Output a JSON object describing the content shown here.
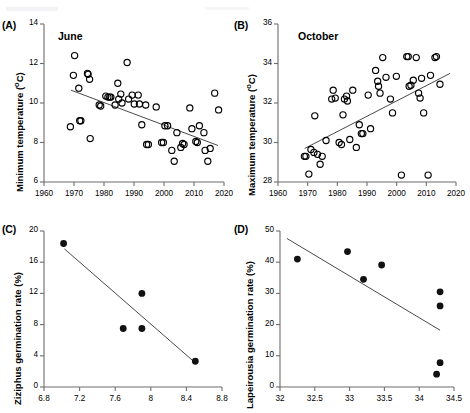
{
  "figure": {
    "width": 463,
    "height": 413,
    "background": "#ffffff",
    "marker_open_color": "#000000",
    "marker_filled_color": "#111111",
    "axis_color": "#6d6d6d",
    "trend_color": "#4a4a4a"
  },
  "chart_data": [
    {
      "type": "scatter",
      "panel": "A",
      "tag": "(A)",
      "title": "June",
      "xlabel": "",
      "ylabel": "Minimum temperature (oC)",
      "xlim": [
        1960,
        2020
      ],
      "ylim": [
        6,
        14
      ],
      "xticks": [
        1960,
        1970,
        1980,
        1990,
        2000,
        2010,
        2020
      ],
      "xtick_labels": [
        "1960",
        "1970",
        "1980",
        "1990",
        "2000",
        "2010",
        "2020"
      ],
      "yticks": [
        6,
        8,
        10,
        12,
        14
      ],
      "ytick_labels": [
        "6",
        "8",
        "10",
        "12",
        "14"
      ],
      "grid": false,
      "legend": "none",
      "marker": "open-circle",
      "trend": {
        "x": [
          1969,
          2018
        ],
        "y": [
          10.65,
          7.85
        ]
      },
      "points": [
        [
          1968.8,
          8.8
        ],
        [
          1969.8,
          11.4
        ],
        [
          1970.2,
          12.4
        ],
        [
          1971.6,
          10.75
        ],
        [
          1971.9,
          9.1
        ],
        [
          1972.3,
          9.1
        ],
        [
          1974.5,
          11.5
        ],
        [
          1974.7,
          11.45
        ],
        [
          1975.2,
          11.2
        ],
        [
          1975.4,
          8.2
        ],
        [
          1978.4,
          9.9
        ],
        [
          1978.9,
          9.85
        ],
        [
          1980.6,
          10.35
        ],
        [
          1981.3,
          10.3
        ],
        [
          1981.9,
          10.3
        ],
        [
          1982.3,
          10.3
        ],
        [
          1983.7,
          9.9
        ],
        [
          1984.6,
          11.0
        ],
        [
          1984.9,
          10.2
        ],
        [
          1985.6,
          10.45
        ],
        [
          1986.0,
          10.0
        ],
        [
          1987.7,
          12.05
        ],
        [
          1988.2,
          10.2
        ],
        [
          1989.4,
          10.4
        ],
        [
          1990.1,
          9.95
        ],
        [
          1991.4,
          10.4
        ],
        [
          1991.8,
          9.95
        ],
        [
          1992.6,
          8.9
        ],
        [
          1993.9,
          9.9
        ],
        [
          1994.2,
          7.9
        ],
        [
          1994.8,
          7.9
        ],
        [
          1997.4,
          9.8
        ],
        [
          1999.2,
          8.0
        ],
        [
          1999.8,
          8.0
        ],
        [
          2000.3,
          8.85
        ],
        [
          2001.2,
          8.85
        ],
        [
          2002.6,
          7.6
        ],
        [
          2003.4,
          7.05
        ],
        [
          2004.3,
          8.5
        ],
        [
          2005.6,
          7.75
        ],
        [
          2006.2,
          7.95
        ],
        [
          2006.7,
          7.9
        ],
        [
          2008.6,
          9.75
        ],
        [
          2009.3,
          8.7
        ],
        [
          2010.6,
          8.05
        ],
        [
          2011.1,
          8.0
        ],
        [
          2011.8,
          8.85
        ],
        [
          2013.3,
          8.5
        ],
        [
          2013.7,
          7.6
        ],
        [
          2014.6,
          7.05
        ],
        [
          2015.4,
          7.7
        ],
        [
          2016.9,
          10.5
        ],
        [
          2018.2,
          9.65
        ]
      ]
    },
    {
      "type": "scatter",
      "panel": "B",
      "tag": "(B)",
      "title": "October",
      "xlabel": "",
      "ylabel": "Maximum temperature (oC)",
      "xlim": [
        1960,
        2020
      ],
      "ylim": [
        28,
        36
      ],
      "xticks": [
        1960,
        1970,
        1980,
        1990,
        2000,
        2010,
        2020
      ],
      "xtick_labels": [
        "1960",
        "1970",
        "1980",
        "1990",
        "2000",
        "2010",
        "2020"
      ],
      "yticks": [
        28,
        30,
        32,
        34,
        36
      ],
      "ytick_labels": [
        "28",
        "30",
        "32",
        "34",
        "36"
      ],
      "grid": false,
      "legend": "none",
      "marker": "open-circle",
      "trend": {
        "x": [
          1969,
          2018
        ],
        "y": [
          29.7,
          33.5
        ]
      },
      "points": [
        [
          1968.9,
          29.3
        ],
        [
          1969.4,
          29.3
        ],
        [
          1970.4,
          28.4
        ],
        [
          1971.1,
          29.65
        ],
        [
          1972.1,
          29.5
        ],
        [
          1972.4,
          31.35
        ],
        [
          1973.3,
          29.4
        ],
        [
          1974.2,
          28.9
        ],
        [
          1974.9,
          29.3
        ],
        [
          1976.2,
          30.1
        ],
        [
          1978.1,
          32.2
        ],
        [
          1778.9,
          30.0
        ],
        [
          1978.6,
          32.65
        ],
        [
          1979.3,
          32.25
        ],
        [
          1980.6,
          30.0
        ],
        [
          1981.4,
          29.9
        ],
        [
          1981.9,
          31.4
        ],
        [
          1982.4,
          32.2
        ],
        [
          1983.1,
          32.35
        ],
        [
          1983.4,
          32.1
        ],
        [
          1984.2,
          30.15
        ],
        [
          1985.2,
          32.65
        ],
        [
          1986.4,
          29.75
        ],
        [
          1987.4,
          30.9
        ],
        [
          1988.1,
          30.45
        ],
        [
          1988.6,
          30.45
        ],
        [
          1990.4,
          32.4
        ],
        [
          1991.2,
          30.7
        ],
        [
          1992.9,
          33.65
        ],
        [
          1993.6,
          33.1
        ],
        [
          1993.9,
          32.85
        ],
        [
          1994.4,
          32.5
        ],
        [
          1995.3,
          34.3
        ],
        [
          1996.4,
          33.3
        ],
        [
          1997.9,
          32.2
        ],
        [
          1998.6,
          31.5
        ],
        [
          1999.9,
          33.35
        ],
        [
          2001.6,
          28.35
        ],
        [
          2003.4,
          34.35
        ],
        [
          2003.9,
          34.35
        ],
        [
          2004.2,
          32.85
        ],
        [
          2004.8,
          32.9
        ],
        [
          2005.6,
          33.15
        ],
        [
          2006.6,
          34.3
        ],
        [
          2007.4,
          32.5
        ],
        [
          2007.9,
          32.25
        ],
        [
          2008.4,
          33.25
        ],
        [
          2009.1,
          31.5
        ],
        [
          2010.6,
          28.35
        ],
        [
          2011.4,
          33.4
        ],
        [
          2012.9,
          34.3
        ],
        [
          2013.4,
          34.35
        ],
        [
          2014.6,
          32.95
        ]
      ]
    },
    {
      "type": "scatter",
      "panel": "C",
      "tag": "(C)",
      "title": "",
      "xlabel": "",
      "ylabel": "Ziziphus germination rate (%)",
      "xlim": [
        6.8,
        8.8
      ],
      "ylim": [
        0,
        20
      ],
      "xticks": [
        6.8,
        7.2,
        7.6,
        8.0,
        8.4,
        8.8
      ],
      "xtick_labels": [
        "6.8",
        "7.2",
        "7.6",
        "8",
        "8.4",
        "8.8"
      ],
      "yticks": [
        0,
        4,
        8,
        12,
        16,
        20
      ],
      "ytick_labels": [
        "0",
        "4",
        "8",
        "12",
        "16",
        "20"
      ],
      "grid": false,
      "legend": "none",
      "marker": "filled-circle",
      "trend": {
        "x": [
          7.03,
          8.5
        ],
        "y": [
          17.7,
          3.1
        ]
      },
      "points": [
        [
          7.02,
          18.4
        ],
        [
          7.69,
          7.5
        ],
        [
          7.9,
          12.0
        ],
        [
          7.9,
          7.5
        ],
        [
          8.5,
          3.3
        ]
      ]
    },
    {
      "type": "scatter",
      "panel": "D",
      "tag": "(D)",
      "title": "",
      "xlabel": "",
      "ylabel": "Lapeirousia germination rate (%)",
      "xlim": [
        32,
        34.5
      ],
      "ylim": [
        0,
        50
      ],
      "xticks": [
        32,
        32.5,
        33,
        33.5,
        34,
        34.5
      ],
      "xtick_labels": [
        "32",
        "32.5",
        "33",
        "33.5",
        "34",
        "34.5"
      ],
      "yticks": [
        0,
        10,
        20,
        30,
        40,
        50
      ],
      "ytick_labels": [
        "0",
        "10",
        "20",
        "30",
        "40",
        "50"
      ],
      "grid": false,
      "legend": "none",
      "marker": "filled-circle",
      "trend": {
        "x": [
          32.1,
          34.3
        ],
        "y": [
          47.6,
          18.2
        ]
      },
      "points": [
        [
          32.25,
          41.0
        ],
        [
          32.97,
          43.4
        ],
        [
          33.2,
          34.5
        ],
        [
          33.46,
          39.1
        ],
        [
          34.3,
          30.5
        ],
        [
          34.3,
          26.0
        ],
        [
          34.3,
          7.8
        ],
        [
          34.25,
          4.1
        ]
      ]
    }
  ]
}
